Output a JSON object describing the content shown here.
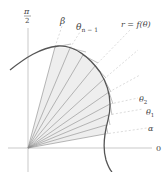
{
  "diagram": {
    "colors": {
      "curve": "#555555",
      "rays": "#888888",
      "sector_fill": "#eeeeee",
      "axis": "#bbbbbb",
      "dashed": "#cccccc",
      "text": "#444444"
    },
    "labels": {
      "pi_over_2_num": "π",
      "pi_over_2_den": "2",
      "zero": "0",
      "beta": "β",
      "theta_n_minus_1": "θ",
      "theta_n_minus_1_sub": "n − 1",
      "curve_eq": "r = f(θ)",
      "theta_2": "θ",
      "theta_2_sub": "2",
      "theta_1": "θ",
      "theta_1_sub": "1",
      "alpha": "α"
    },
    "origin": [
      28,
      148
    ],
    "sector_count": 10
  }
}
